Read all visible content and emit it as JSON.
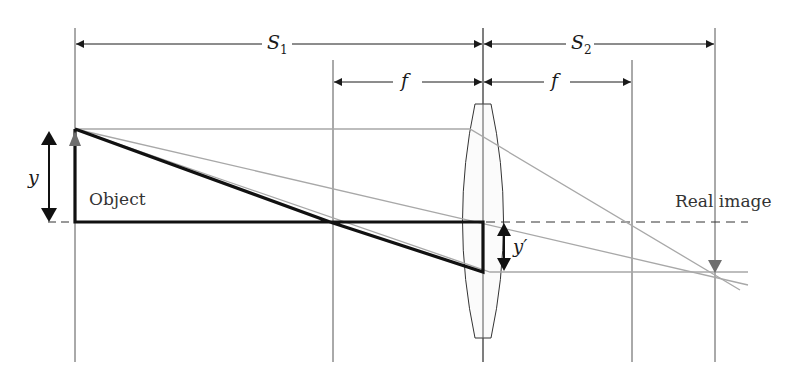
{
  "diagram": {
    "dimensions": {
      "s1": {
        "symbol": "S",
        "subscript": "1"
      },
      "s2": {
        "symbol": "S",
        "subscript": "2"
      },
      "f_left": {
        "symbol": "f"
      },
      "f_right": {
        "symbol": "f"
      }
    },
    "labels": {
      "object_height": "y",
      "image_height": "y′",
      "object": "Object",
      "real_image": "Real image"
    },
    "geometry": {
      "object_x": 75,
      "focal_left_x": 333,
      "lens_x": 483,
      "focal_right_x": 632,
      "image_x": 715,
      "optical_axis_y": 222,
      "object_top_y": 129,
      "image_tip_y": 271
    },
    "colors": {
      "line": "#1a1a1a",
      "ray": "#a8a8a8",
      "guide": "#555555",
      "arrow_gray": "#6e6e6e"
    }
  }
}
